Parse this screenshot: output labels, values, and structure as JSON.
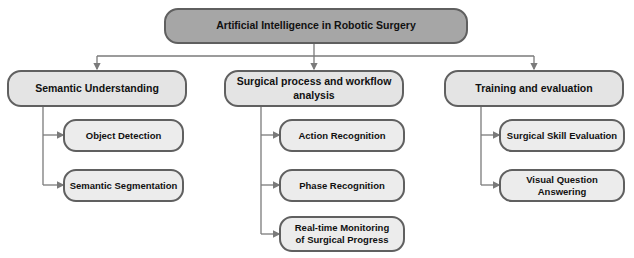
{
  "diagram": {
    "root": {
      "label": "Artificial Intelligence in Robotic Surgery"
    },
    "branches": [
      {
        "label": "Semantic Understanding",
        "children": [
          {
            "label": "Object Detection"
          },
          {
            "label": "Semantic Segmentation"
          }
        ]
      },
      {
        "label": "Surgical process and workflow analysis",
        "children": [
          {
            "label": "Action Recognition"
          },
          {
            "label": "Phase Recognition"
          },
          {
            "label": "Real-time Monitoring of Surgical Progress"
          }
        ]
      },
      {
        "label": "Training and evaluation",
        "children": [
          {
            "label": "Surgical Skill Evaluation"
          },
          {
            "label": "Visual Question Answering"
          }
        ]
      }
    ],
    "colors": {
      "root_fill": "#a6a6a6",
      "node_fill": "#e4e4e4",
      "border": "#606060",
      "connector": "#7a7a7a"
    }
  }
}
